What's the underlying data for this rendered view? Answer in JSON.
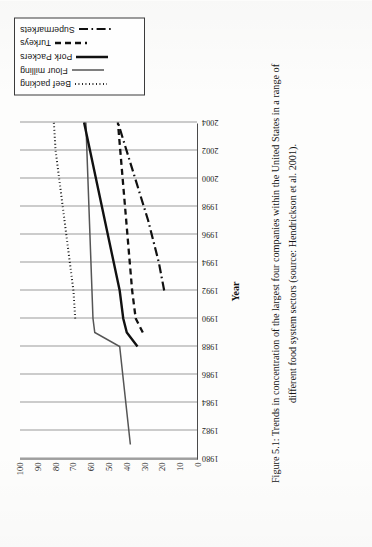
{
  "figure": {
    "caption": "Figure 5.1: Trends in concentration of the largest four companies within the United States in a range of different food system sectors (source: Hendrickson et al. 2001)."
  },
  "legend": {
    "position": "right",
    "entries": [
      {
        "label": "Beef packing",
        "style": "dotted",
        "color": "#111111"
      },
      {
        "label": "Flour milling",
        "style": "solid",
        "color": "#555555"
      },
      {
        "label": "Pork Packers",
        "style": "solid",
        "color": "#111111"
      },
      {
        "label": "Turkeys",
        "style": "dashed",
        "color": "#111111"
      },
      {
        "label": "Supermarkets",
        "style": "dash-dot",
        "color": "#111111"
      }
    ]
  },
  "chart_data": {
    "type": "line",
    "title": "",
    "xlabel": "Year",
    "ylabel": "",
    "xlim": [
      1980,
      2004
    ],
    "ylim": [
      0,
      100
    ],
    "grid": true,
    "xticks": [
      1980,
      1982,
      1984,
      1986,
      1988,
      1990,
      1992,
      1994,
      1996,
      1998,
      2000,
      2002,
      2004
    ],
    "yticks": [
      0,
      10,
      20,
      30,
      40,
      50,
      60,
      70,
      80,
      90,
      100
    ],
    "xtick_labels": [
      "1980",
      "1982",
      "1984",
      "1986",
      "1988",
      "1990",
      "1992",
      "1994",
      "1996",
      "1998",
      "2000",
      "2002",
      "2004"
    ],
    "ytick_labels": [
      "0",
      "10",
      "20",
      "30",
      "40",
      "50",
      "60",
      "70",
      "80",
      "90",
      "100"
    ],
    "series": [
      {
        "name": "Beef packing",
        "style": "dotted",
        "color": "#111111",
        "x": [
          1990,
          1992,
          1994,
          1996,
          1998,
          2000,
          2002,
          2004
        ],
        "values": [
          69,
          70,
          72,
          74,
          76,
          78,
          80,
          81
        ]
      },
      {
        "name": "Flour milling",
        "style": "solid",
        "color": "#555555",
        "x": [
          1981,
          1988,
          1989,
          1990,
          2004
        ],
        "values": [
          38,
          44,
          58,
          59,
          63
        ]
      },
      {
        "name": "Pork Packers",
        "style": "solid",
        "color": "#111111",
        "x": [
          1988,
          1989,
          1990,
          1992,
          2004
        ],
        "values": [
          34,
          40,
          42,
          44,
          64
        ]
      },
      {
        "name": "Turkeys",
        "style": "dashed",
        "color": "#111111",
        "x": [
          1989,
          1990,
          1992,
          2004
        ],
        "values": [
          31,
          35,
          37,
          45
        ]
      },
      {
        "name": "Supermarkets",
        "style": "dash-dot",
        "color": "#111111",
        "x": [
          1992,
          1994,
          1997,
          2004
        ],
        "values": [
          19,
          22,
          28,
          45
        ]
      }
    ]
  }
}
